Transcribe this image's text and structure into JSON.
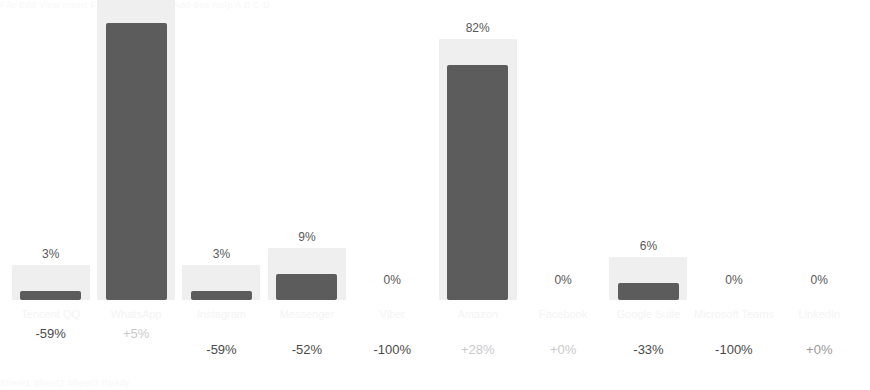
{
  "chart_data": {
    "type": "bar",
    "title": "",
    "subtitle": "",
    "xlabel": "",
    "ylabel": "",
    "ylim": [
      0,
      100
    ],
    "grid": false,
    "legend": null,
    "value_suffix": "%",
    "categories": [
      "Tencent QQ",
      "WhatsApp",
      "Instagram",
      "Messenger",
      "Viber",
      "Amazon",
      "Facebook",
      "Google Suite",
      "Microsoft Teams",
      "LinkedIn"
    ],
    "values": [
      3,
      97,
      3,
      9,
      0,
      82,
      0,
      6,
      0,
      0
    ],
    "value_labels": [
      "3%",
      "97%",
      "3%",
      "9%",
      "0%",
      "82%",
      "0%",
      "6%",
      "0%",
      "0%"
    ],
    "deltas": [
      "-59%",
      "+5%",
      "-59%",
      "-52%",
      "-100%",
      "+28%",
      "+0%",
      "-33%",
      "-100%",
      "+0%"
    ],
    "colors": {
      "bar": "#5c5c5c",
      "track": "#efefef",
      "value_text": "#585858",
      "category_text": "#f4f4f5",
      "background": "#ffffff"
    }
  },
  "ghost": {
    "top": "File  Edit  View  Insert  Format  Data  Tools  Add-ons  Help     A       B       C                    D",
    "bottom": "Sheet1    Sheet2    Sheet3                                                          Ready"
  },
  "bars": [
    {
      "label": "3%",
      "category": "Tencent QQ",
      "delta": "-59%",
      "value": 3,
      "delta_style": "dark",
      "delta_row": "high"
    },
    {
      "label": "97%",
      "category": "WhatsApp",
      "delta": "+5%",
      "value": 97,
      "delta_style": "faint",
      "delta_row": "high"
    },
    {
      "label": "3%",
      "category": "Instagram",
      "delta": "-59%",
      "value": 3,
      "delta_style": "dark",
      "delta_row": "low"
    },
    {
      "label": "9%",
      "category": "Messenger",
      "delta": "-52%",
      "value": 9,
      "delta_style": "dark",
      "delta_row": "low"
    },
    {
      "label": "0%",
      "category": "Viber",
      "delta": "-100%",
      "value": 0,
      "delta_style": "dark",
      "delta_row": "low"
    },
    {
      "label": "82%",
      "category": "Amazon",
      "delta": "+28%",
      "value": 82,
      "delta_style": "faint",
      "delta_row": "low"
    },
    {
      "label": "0%",
      "category": "Facebook",
      "delta": "+0%",
      "value": 0,
      "delta_style": "faint",
      "delta_row": "low"
    },
    {
      "label": "6%",
      "category": "Google Suite",
      "delta": "-33%",
      "value": 6,
      "delta_style": "dark",
      "delta_row": "low"
    },
    {
      "label": "0%",
      "category": "Microsoft Teams",
      "delta": "-100%",
      "value": 0,
      "delta_style": "dark",
      "delta_row": "low"
    },
    {
      "label": "0%",
      "category": "LinkedIn",
      "delta": "+0%",
      "value": 0,
      "delta_style": "mid",
      "delta_row": "low"
    }
  ]
}
